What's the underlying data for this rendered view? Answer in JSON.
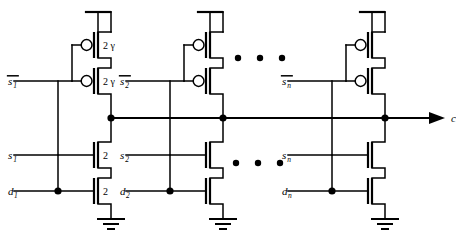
{
  "figure": {
    "type": "cmos-transistor-schematic",
    "title": "",
    "background_color": "#ffffff",
    "line_color": "#000000",
    "width": 456,
    "height": 246
  },
  "output": {
    "label": "c",
    "arrow": "right-arrow-icon",
    "rail_name": "output-rail"
  },
  "ellipsis": {
    "glyph": "•",
    "count": 3,
    "top_label": "• • •",
    "bottom_label": "• • •"
  },
  "supply": {
    "vdd_symbol": "vdd-bar-icon",
    "gnd_symbol": "ground-icon"
  },
  "stages": [
    {
      "id": "stage-1",
      "index": "1",
      "inputs": {
        "sbar": {
          "base": "s",
          "sub": "1",
          "overbar": true
        },
        "s": {
          "base": "s",
          "sub": "1",
          "overbar": false
        },
        "d": {
          "base": "d",
          "sub": "1",
          "overbar": false
        }
      },
      "devices": [
        {
          "name": "pmos-top",
          "type": "pmos",
          "size": "2",
          "gamma": "γ"
        },
        {
          "name": "pmos-bottom",
          "type": "pmos",
          "size": "2",
          "gamma": "γ"
        },
        {
          "name": "nmos-top",
          "type": "nmos",
          "size": "2",
          "gamma": ""
        },
        {
          "name": "nmos-bottom",
          "type": "nmos",
          "size": "2",
          "gamma": ""
        }
      ],
      "size_labels": [
        "2 γ",
        "2 γ",
        "2",
        "2"
      ],
      "show_size_labels": true
    },
    {
      "id": "stage-2",
      "index": "2",
      "inputs": {
        "sbar": {
          "base": "s",
          "sub": "2",
          "overbar": true
        },
        "s": {
          "base": "s",
          "sub": "2",
          "overbar": false
        },
        "d": {
          "base": "d",
          "sub": "2",
          "overbar": false
        }
      },
      "devices": [
        {
          "name": "pmos-top",
          "type": "pmos",
          "size": "",
          "gamma": ""
        },
        {
          "name": "pmos-bottom",
          "type": "pmos",
          "size": "",
          "gamma": ""
        },
        {
          "name": "nmos-top",
          "type": "nmos",
          "size": "",
          "gamma": ""
        },
        {
          "name": "nmos-bottom",
          "type": "nmos",
          "size": "",
          "gamma": ""
        }
      ],
      "size_labels": [
        "",
        "",
        "",
        ""
      ],
      "show_size_labels": false
    },
    {
      "id": "stage-n",
      "index": "n",
      "inputs": {
        "sbar": {
          "base": "s",
          "sub": "n",
          "overbar": true
        },
        "s": {
          "base": "s",
          "sub": "n",
          "overbar": false
        },
        "d": {
          "base": "d",
          "sub": "n",
          "overbar": false
        }
      },
      "devices": [
        {
          "name": "pmos-top",
          "type": "pmos",
          "size": "",
          "gamma": ""
        },
        {
          "name": "pmos-bottom",
          "type": "pmos",
          "size": "",
          "gamma": ""
        },
        {
          "name": "nmos-top",
          "type": "nmos",
          "size": "",
          "gamma": ""
        },
        {
          "name": "nmos-bottom",
          "type": "nmos",
          "size": "",
          "gamma": ""
        }
      ],
      "size_labels": [
        "",
        "",
        "",
        ""
      ],
      "show_size_labels": false
    }
  ]
}
